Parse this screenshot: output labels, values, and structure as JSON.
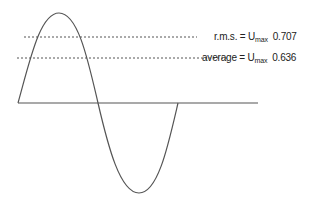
{
  "diagram": {
    "type": "sine-wave-rms-average",
    "labels": {
      "rms": {
        "prefix": "r.m.s. = U",
        "subscript": "max",
        "value": "0.707"
      },
      "average": {
        "prefix": "average = U",
        "subscript": "max",
        "value": "0.636"
      }
    },
    "colors": {
      "wave": "#555555",
      "axis": "#555555",
      "dotted": "#555555",
      "text": "#222222"
    }
  }
}
